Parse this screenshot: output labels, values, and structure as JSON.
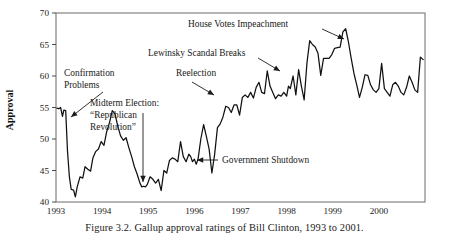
{
  "figure": {
    "caption": "Figure 3.2.  Gallup approval ratings of Bill Clinton, 1993 to 2001."
  },
  "chart_data": {
    "type": "line",
    "title": "",
    "xlabel": "",
    "ylabel": "Approval",
    "ylim": [
      40,
      70
    ],
    "xlim": [
      1993.0,
      2001.0
    ],
    "yticks": [
      40,
      45,
      50,
      55,
      60,
      65,
      70
    ],
    "xticks": [
      1993,
      1994,
      1995,
      1996,
      1997,
      1998,
      1999,
      2000
    ],
    "xtick_labels": [
      "1993",
      "1994",
      "1995",
      "1996",
      "1997",
      "1998",
      "1999",
      "2000"
    ],
    "ytick_labels": [
      "40",
      "45",
      "50",
      "55",
      "60",
      "65",
      "70"
    ],
    "grid": false,
    "legend": null,
    "series": [
      {
        "name": "Gallup approval rating",
        "color": "#111111",
        "x": [
          1993.02,
          1993.06,
          1993.1,
          1993.14,
          1993.17,
          1993.21,
          1993.25,
          1993.29,
          1993.33,
          1993.38,
          1993.42,
          1993.46,
          1993.52,
          1993.58,
          1993.63,
          1993.69,
          1993.75,
          1993.8,
          1993.86,
          1993.92,
          1993.98,
          1994.04,
          1994.1,
          1994.16,
          1994.22,
          1994.28,
          1994.34,
          1994.4,
          1994.46,
          1994.52,
          1994.58,
          1994.64,
          1994.7,
          1994.76,
          1994.82,
          1994.86,
          1994.9,
          1994.94,
          1994.98,
          1995.04,
          1995.1,
          1995.16,
          1995.22,
          1995.28,
          1995.34,
          1995.4,
          1995.46,
          1995.52,
          1995.58,
          1995.64,
          1995.7,
          1995.76,
          1995.82,
          1995.88,
          1995.92,
          1995.96,
          1996.0,
          1996.04,
          1996.08,
          1996.14,
          1996.2,
          1996.26,
          1996.32,
          1996.38,
          1996.44,
          1996.5,
          1996.56,
          1996.62,
          1996.68,
          1996.74,
          1996.8,
          1996.86,
          1996.92,
          1996.98,
          1997.04,
          1997.1,
          1997.16,
          1997.22,
          1997.28,
          1997.34,
          1997.4,
          1997.46,
          1997.52,
          1997.58,
          1997.64,
          1997.7,
          1997.76,
          1997.82,
          1997.88,
          1997.94,
          1998.0,
          1998.04,
          1998.08,
          1998.14,
          1998.2,
          1998.26,
          1998.32,
          1998.38,
          1998.44,
          1998.5,
          1998.56,
          1998.62,
          1998.68,
          1998.74,
          1998.8,
          1998.86,
          1998.92,
          1998.98,
          1999.04,
          1999.1,
          1999.16,
          1999.22,
          1999.28,
          1999.34,
          1999.4,
          1999.46,
          1999.52,
          1999.58,
          1999.64,
          1999.7,
          1999.76,
          1999.82,
          1999.88,
          1999.94,
          2000.0,
          2000.06,
          2000.12,
          2000.18,
          2000.24,
          2000.3,
          2000.36,
          2000.42,
          2000.48,
          2000.54,
          2000.6,
          2000.66,
          2000.72,
          2000.78,
          2000.84,
          2000.9,
          2000.96
        ],
        "y": [
          54.9,
          54.8,
          55.0,
          53.6,
          54.6,
          54.5,
          48.0,
          44.0,
          42.0,
          41.9,
          40.8,
          42.4,
          44.0,
          43.8,
          45.6,
          45.2,
          44.9,
          47.0,
          48.0,
          48.4,
          49.6,
          49.0,
          51.2,
          52.6,
          54.5,
          54.0,
          52.0,
          50.5,
          49.8,
          50.2,
          48.6,
          47.2,
          45.6,
          44.4,
          43.0,
          42.4,
          42.5,
          42.4,
          42.8,
          44.0,
          43.6,
          43.0,
          43.6,
          41.8,
          45.0,
          44.6,
          46.6,
          47.0,
          46.8,
          46.4,
          49.6,
          47.2,
          46.4,
          47.6,
          47.2,
          46.4,
          46.8,
          46.0,
          46.8,
          50.0,
          52.3,
          50.4,
          48.4,
          44.6,
          47.6,
          51.8,
          52.4,
          53.5,
          55.2,
          55.0,
          54.2,
          55.4,
          55.4,
          53.8,
          56.6,
          57.0,
          56.6,
          57.4,
          56.5,
          58.2,
          59.0,
          57.4,
          57.2,
          60.8,
          58.4,
          57.4,
          56.4,
          57.0,
          56.8,
          57.4,
          56.8,
          58.4,
          58.0,
          60.0,
          57.0,
          61.0,
          58.4,
          56.2,
          62.0,
          65.6,
          65.0,
          64.6,
          63.6,
          60.1,
          62.8,
          62.8,
          62.8,
          63.4,
          64.4,
          64.5,
          64.6,
          67.0,
          67.5,
          65.4,
          62.8,
          60.4,
          58.6,
          56.6,
          58.2,
          60.2,
          60.1,
          58.6,
          57.8,
          57.4,
          58.0,
          62.0,
          58.0,
          57.4,
          56.8,
          58.6,
          59.0,
          58.4,
          57.4,
          57.0,
          58.2,
          60.0,
          59.0,
          57.8,
          57.4,
          63.0,
          62.6
        ]
      }
    ],
    "annotations": [
      {
        "id": "confirmation-problems",
        "label_lines": [
          "Confirmation",
          "Problems"
        ],
        "text_x": 64,
        "text_y": 76,
        "align": "start",
        "leader": {
          "x1": 103,
          "y1": 92,
          "x2": 71,
          "y2": 117
        }
      },
      {
        "id": "midterm-election",
        "label_lines": [
          "Midterm Election:",
          "“Republican",
          "Revolution”"
        ],
        "text_x": 90,
        "text_y": 106,
        "align": "start",
        "leader": {
          "x1": 143,
          "y1": 113,
          "x2": 143,
          "y2": 182
        }
      },
      {
        "id": "reelection",
        "label_lines": [
          "Reelection"
        ],
        "text_x": 176,
        "text_y": 76,
        "align": "start",
        "leader": {
          "x1": 192,
          "y1": 82,
          "x2": 214,
          "y2": 95
        }
      },
      {
        "id": "lewinsky-scandal",
        "label_lines": [
          "Lewinsky Scandal Breaks"
        ],
        "text_x": 148,
        "text_y": 56,
        "align": "start",
        "leader": {
          "x1": 258,
          "y1": 58,
          "x2": 280,
          "y2": 71
        }
      },
      {
        "id": "house-votes-impeachment",
        "label_lines": [
          "House Votes Impeachment"
        ],
        "text_x": 188,
        "text_y": 27,
        "align": "start",
        "leader": {
          "x1": 322,
          "y1": 29,
          "x2": 344,
          "y2": 39
        }
      },
      {
        "id": "government-shutdown",
        "label_lines": [
          "Government Shutdown"
        ],
        "text_x": 222,
        "text_y": 163,
        "align": "start",
        "leader": {
          "x1": 218,
          "y1": 160,
          "x2": 197,
          "y2": 160
        }
      }
    ]
  }
}
